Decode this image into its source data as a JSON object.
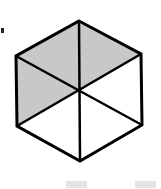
{
  "diagram": {
    "shape": "regular-hexagon",
    "divisions": 6,
    "shaded_count": 3,
    "shaded_sectors": [
      "top-left",
      "top-right",
      "left"
    ],
    "colors": {
      "stroke": "#000000",
      "shade": "#c8c8c8",
      "background": "#ffffff"
    }
  }
}
